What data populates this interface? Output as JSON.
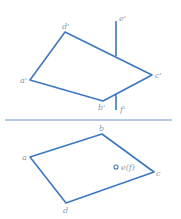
{
  "colors": {
    "line": "#3a78c2",
    "label": "#8a9ab0",
    "axis": "#4a7fc4"
  },
  "front_view": {
    "labels": {
      "a": "a'",
      "b": "b'",
      "c": "c'",
      "d": "d'",
      "e": "e'",
      "f": "f'"
    }
  },
  "top_view": {
    "labels": {
      "a": "a",
      "b": "b",
      "c": "c",
      "d": "d",
      "ef": "e(f)"
    }
  }
}
